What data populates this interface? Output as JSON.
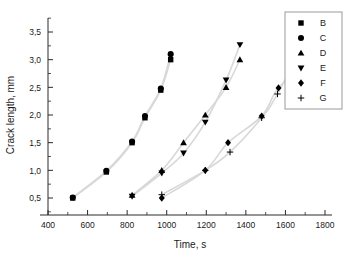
{
  "chart_data": {
    "type": "scatter",
    "title": "",
    "xlabel": "Time, s",
    "ylabel": "Crack length, mm",
    "xlim": [
      400,
      1850
    ],
    "ylim": [
      0.3,
      3.7
    ],
    "xticks": [
      400,
      600,
      800,
      1000,
      1200,
      1400,
      1600,
      1800
    ],
    "xticklabels": [
      "400",
      "600",
      "800",
      "1000",
      "1200",
      "1400",
      "1600",
      "1800"
    ],
    "yticks": [
      0.5,
      1.0,
      1.5,
      2.0,
      2.5,
      3.0,
      3.5
    ],
    "yticklabels": [
      "0,5",
      "1,0",
      "1,5",
      "2,0",
      "2,5",
      "3,0",
      "3,5"
    ],
    "grid": false,
    "legend_position": "upper right",
    "decimal_separator": ",",
    "series": [
      {
        "name": "B",
        "marker": "square",
        "x": [
          525,
          695,
          825,
          890,
          970,
          1020
        ],
        "y": [
          0.5,
          0.97,
          1.5,
          1.95,
          2.45,
          3.0
        ]
      },
      {
        "name": "C",
        "marker": "circle",
        "x": [
          525,
          695,
          825,
          890,
          970,
          1020
        ],
        "y": [
          0.51,
          0.99,
          1.52,
          1.98,
          2.48,
          3.1
        ]
      },
      {
        "name": "D",
        "marker": "triangle-up",
        "x": [
          825,
          975,
          1085,
          1195,
          1300,
          1370
        ],
        "y": [
          0.55,
          1.0,
          1.5,
          2.0,
          2.5,
          3.0
        ]
      },
      {
        "name": "E",
        "marker": "triangle-down",
        "x": [
          825,
          975,
          1085,
          1195,
          1300,
          1370
        ],
        "y": [
          0.53,
          0.95,
          1.31,
          1.87,
          2.63,
          3.27
        ]
      },
      {
        "name": "F",
        "marker": "diamond",
        "x": [
          975,
          1195,
          1310,
          1480,
          1565,
          1720
        ],
        "y": [
          0.5,
          1.0,
          1.5,
          1.98,
          2.49,
          2.99
        ]
      },
      {
        "name": "G",
        "marker": "plus",
        "x": [
          975,
          1195,
          1320,
          1480,
          1560,
          1720
        ],
        "y": [
          0.56,
          1.0,
          1.33,
          1.95,
          2.38,
          3.48
        ]
      }
    ]
  },
  "legend": {
    "entries": [
      {
        "label": "B",
        "marker": "square"
      },
      {
        "label": "C",
        "marker": "circle"
      },
      {
        "label": "D",
        "marker": "triangle-up"
      },
      {
        "label": "E",
        "marker": "triangle-down"
      },
      {
        "label": "F",
        "marker": "diamond"
      },
      {
        "label": "G",
        "marker": "plus"
      }
    ]
  },
  "axes": {
    "x_title": "Time, s",
    "y_title": "Crack length, mm"
  }
}
